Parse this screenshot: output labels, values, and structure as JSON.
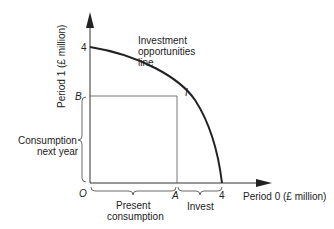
{
  "diagram": {
    "y_axis_label": "Period 1 (£ million)",
    "x_axis_label": "Period 0 (£ million)",
    "y_tick": "4",
    "x_tick": "4",
    "origin": "O",
    "point_b": "B",
    "point_a": "A",
    "point_i": "I",
    "curve_label_line1": "Investment",
    "curve_label_line2": "opportunities",
    "curve_label_line3": "line",
    "brace_consumption_next_line1": "Consumption",
    "brace_consumption_next_line2": "next year",
    "brace_present_line1": "Present",
    "brace_present_line2": "consumption",
    "brace_invest": "Invest",
    "colors": {
      "line": "#222222",
      "guide": "#555555"
    }
  }
}
